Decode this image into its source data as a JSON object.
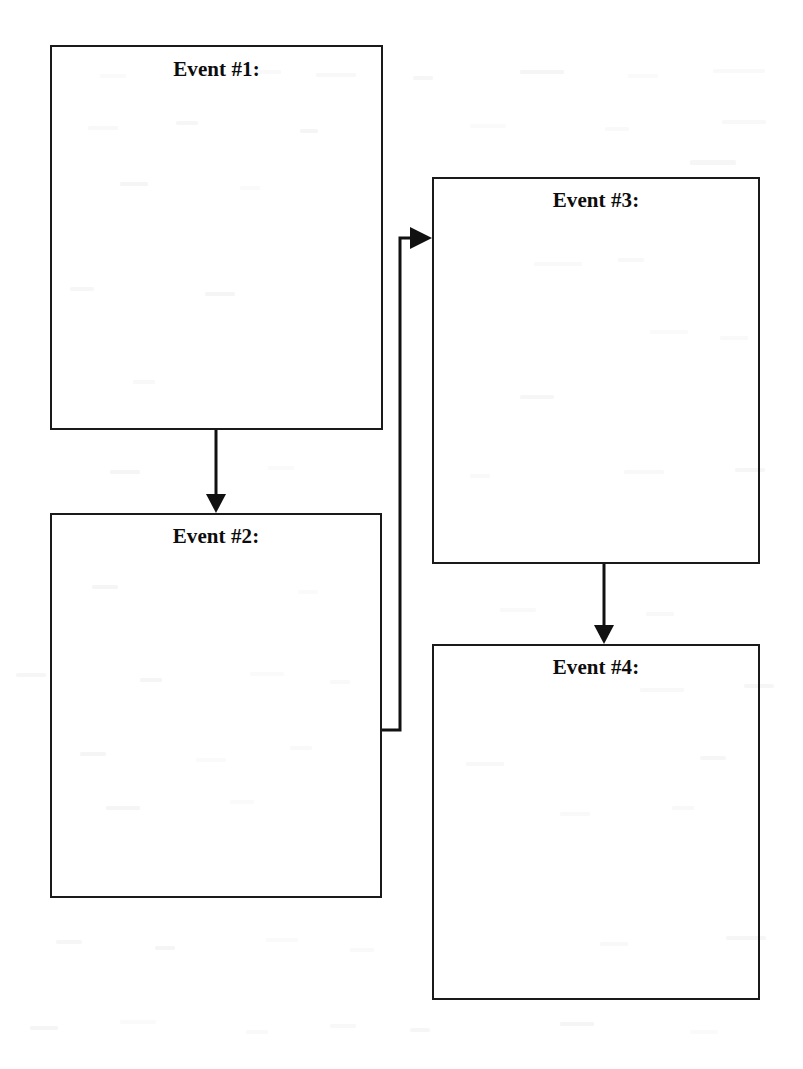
{
  "document": {
    "type": "sequence-chart",
    "title": "Event Sequence Graphic Organizer",
    "page_width": 803,
    "page_height": 1069,
    "background_color": "#ffffff",
    "ink_color": "#111111"
  },
  "boxes": [
    {
      "id": "event-1",
      "label": "Event #1:",
      "x": 50,
      "y": 45,
      "width": 333,
      "height": 385,
      "label_top": 57,
      "border_color": "#1a1a1a",
      "fill": "none"
    },
    {
      "id": "event-2",
      "label": "Event #2:",
      "x": 50,
      "y": 513,
      "width": 332,
      "height": 385,
      "label_top": 524,
      "border_color": "#1a1a1a",
      "fill": "none"
    },
    {
      "id": "event-3",
      "label": "Event #3:",
      "x": 432,
      "y": 177,
      "width": 328,
      "height": 387,
      "label_top": 188,
      "border_color": "#1a1a1a",
      "fill": "none"
    },
    {
      "id": "event-4",
      "label": "Event #4:",
      "x": 432,
      "y": 644,
      "width": 328,
      "height": 356,
      "label_top": 655,
      "border_color": "#1a1a1a",
      "fill": "none"
    }
  ],
  "connectors": [
    {
      "id": "connector-1-to-2",
      "from": "event-1",
      "to": "event-2",
      "direction": "down",
      "path": "M 216 430 L 216 500",
      "arrowhead": "216,513 206,494 226,494"
    },
    {
      "id": "connector-2-to-3",
      "from": "event-2",
      "to": "event-3",
      "direction": "right-up-right",
      "path": "M 382 730 L 400 730 L 400 238 L 413 238",
      "arrowhead": "432,238 410,227 410,249"
    },
    {
      "id": "connector-3-to-4",
      "from": "event-3",
      "to": "event-4",
      "direction": "down",
      "path": "M 604 564 L 604 630",
      "arrowhead": "604,644 594,625 614,625"
    }
  ],
  "speckles": [
    {
      "x": 100,
      "y": 74,
      "w": 26,
      "h": 4
    },
    {
      "x": 247,
      "y": 70,
      "w": 34,
      "h": 4
    },
    {
      "x": 316,
      "y": 73,
      "w": 40,
      "h": 4
    },
    {
      "x": 413,
      "y": 76,
      "w": 20,
      "h": 4
    },
    {
      "x": 520,
      "y": 70,
      "w": 44,
      "h": 4
    },
    {
      "x": 628,
      "y": 74,
      "w": 30,
      "h": 4
    },
    {
      "x": 713,
      "y": 69,
      "w": 52,
      "h": 4
    },
    {
      "x": 88,
      "y": 126,
      "w": 30,
      "h": 4
    },
    {
      "x": 176,
      "y": 121,
      "w": 22,
      "h": 4
    },
    {
      "x": 300,
      "y": 129,
      "w": 18,
      "h": 4
    },
    {
      "x": 470,
      "y": 124,
      "w": 36,
      "h": 4
    },
    {
      "x": 605,
      "y": 127,
      "w": 24,
      "h": 4
    },
    {
      "x": 722,
      "y": 120,
      "w": 44,
      "h": 4
    },
    {
      "x": 690,
      "y": 160,
      "w": 46,
      "h": 5
    },
    {
      "x": 120,
      "y": 182,
      "w": 28,
      "h": 4
    },
    {
      "x": 240,
      "y": 186,
      "w": 20,
      "h": 4
    },
    {
      "x": 534,
      "y": 262,
      "w": 48,
      "h": 4
    },
    {
      "x": 618,
      "y": 258,
      "w": 26,
      "h": 4
    },
    {
      "x": 70,
      "y": 287,
      "w": 24,
      "h": 4
    },
    {
      "x": 205,
      "y": 292,
      "w": 30,
      "h": 4
    },
    {
      "x": 650,
      "y": 330,
      "w": 38,
      "h": 4
    },
    {
      "x": 720,
      "y": 336,
      "w": 28,
      "h": 4
    },
    {
      "x": 133,
      "y": 380,
      "w": 22,
      "h": 4
    },
    {
      "x": 520,
      "y": 395,
      "w": 34,
      "h": 4
    },
    {
      "x": 110,
      "y": 470,
      "w": 30,
      "h": 4
    },
    {
      "x": 268,
      "y": 466,
      "w": 26,
      "h": 4
    },
    {
      "x": 470,
      "y": 474,
      "w": 20,
      "h": 4
    },
    {
      "x": 624,
      "y": 470,
      "w": 40,
      "h": 4
    },
    {
      "x": 735,
      "y": 468,
      "w": 30,
      "h": 4
    },
    {
      "x": 92,
      "y": 585,
      "w": 26,
      "h": 4
    },
    {
      "x": 298,
      "y": 590,
      "w": 20,
      "h": 4
    },
    {
      "x": 500,
      "y": 608,
      "w": 36,
      "h": 4
    },
    {
      "x": 646,
      "y": 612,
      "w": 28,
      "h": 4
    },
    {
      "x": 16,
      "y": 673,
      "w": 30,
      "h": 4
    },
    {
      "x": 140,
      "y": 678,
      "w": 22,
      "h": 4
    },
    {
      "x": 250,
      "y": 672,
      "w": 34,
      "h": 4
    },
    {
      "x": 330,
      "y": 680,
      "w": 20,
      "h": 4
    },
    {
      "x": 640,
      "y": 688,
      "w": 44,
      "h": 4
    },
    {
      "x": 744,
      "y": 684,
      "w": 30,
      "h": 4
    },
    {
      "x": 80,
      "y": 752,
      "w": 26,
      "h": 4
    },
    {
      "x": 196,
      "y": 758,
      "w": 30,
      "h": 4
    },
    {
      "x": 290,
      "y": 746,
      "w": 22,
      "h": 4
    },
    {
      "x": 466,
      "y": 762,
      "w": 38,
      "h": 4
    },
    {
      "x": 700,
      "y": 756,
      "w": 26,
      "h": 4
    },
    {
      "x": 106,
      "y": 806,
      "w": 34,
      "h": 4
    },
    {
      "x": 230,
      "y": 800,
      "w": 24,
      "h": 4
    },
    {
      "x": 560,
      "y": 812,
      "w": 30,
      "h": 4
    },
    {
      "x": 672,
      "y": 806,
      "w": 22,
      "h": 4
    },
    {
      "x": 56,
      "y": 940,
      "w": 26,
      "h": 4
    },
    {
      "x": 155,
      "y": 946,
      "w": 20,
      "h": 4
    },
    {
      "x": 266,
      "y": 938,
      "w": 32,
      "h": 4
    },
    {
      "x": 350,
      "y": 948,
      "w": 24,
      "h": 4
    },
    {
      "x": 600,
      "y": 942,
      "w": 28,
      "h": 4
    },
    {
      "x": 726,
      "y": 936,
      "w": 40,
      "h": 4
    },
    {
      "x": 30,
      "y": 1026,
      "w": 28,
      "h": 4
    },
    {
      "x": 120,
      "y": 1020,
      "w": 36,
      "h": 4
    },
    {
      "x": 246,
      "y": 1030,
      "w": 22,
      "h": 4
    },
    {
      "x": 330,
      "y": 1024,
      "w": 26,
      "h": 4
    },
    {
      "x": 410,
      "y": 1028,
      "w": 20,
      "h": 4
    },
    {
      "x": 560,
      "y": 1022,
      "w": 34,
      "h": 4
    },
    {
      "x": 690,
      "y": 1030,
      "w": 28,
      "h": 4
    }
  ]
}
